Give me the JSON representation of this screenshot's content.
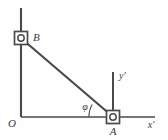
{
  "figure": {
    "background_color": "#fefefe",
    "stroke_color": "#4a4a4a",
    "label_color": "#3a3a3a"
  },
  "labels": {
    "origin": "O",
    "point_b": "B",
    "point_a": "A",
    "axis_x_prime": "x'",
    "axis_y_prime": "y'",
    "angle_phi": "φ"
  },
  "geometry": {
    "origin": {
      "x": 21,
      "y": 117
    },
    "vertical_axis": {
      "x": 21,
      "y_top": 8,
      "y_bottom": 117
    },
    "horizontal_axis": {
      "y": 117,
      "x_left": 21,
      "x_right": 155
    },
    "block_b": {
      "cx": 21,
      "cy": 38,
      "size": 13,
      "pin_r": 3.2
    },
    "block_a": {
      "cx": 113,
      "cy": 117,
      "size": 13,
      "pin_r": 3.2
    },
    "rod": {
      "x1": 21,
      "y1": 38,
      "x2": 113,
      "y2": 117
    },
    "y_prime_axis": {
      "x": 113,
      "y_top": 72,
      "y_bottom": 116
    },
    "angle_arc": {
      "cx": 113,
      "cy": 117,
      "radius": 24,
      "start_deg": 180,
      "end_deg": 220.6
    }
  },
  "icons": {
    "slider_block": "square-slider-block-icon",
    "pin_joint": "pin-joint-circle-icon"
  }
}
